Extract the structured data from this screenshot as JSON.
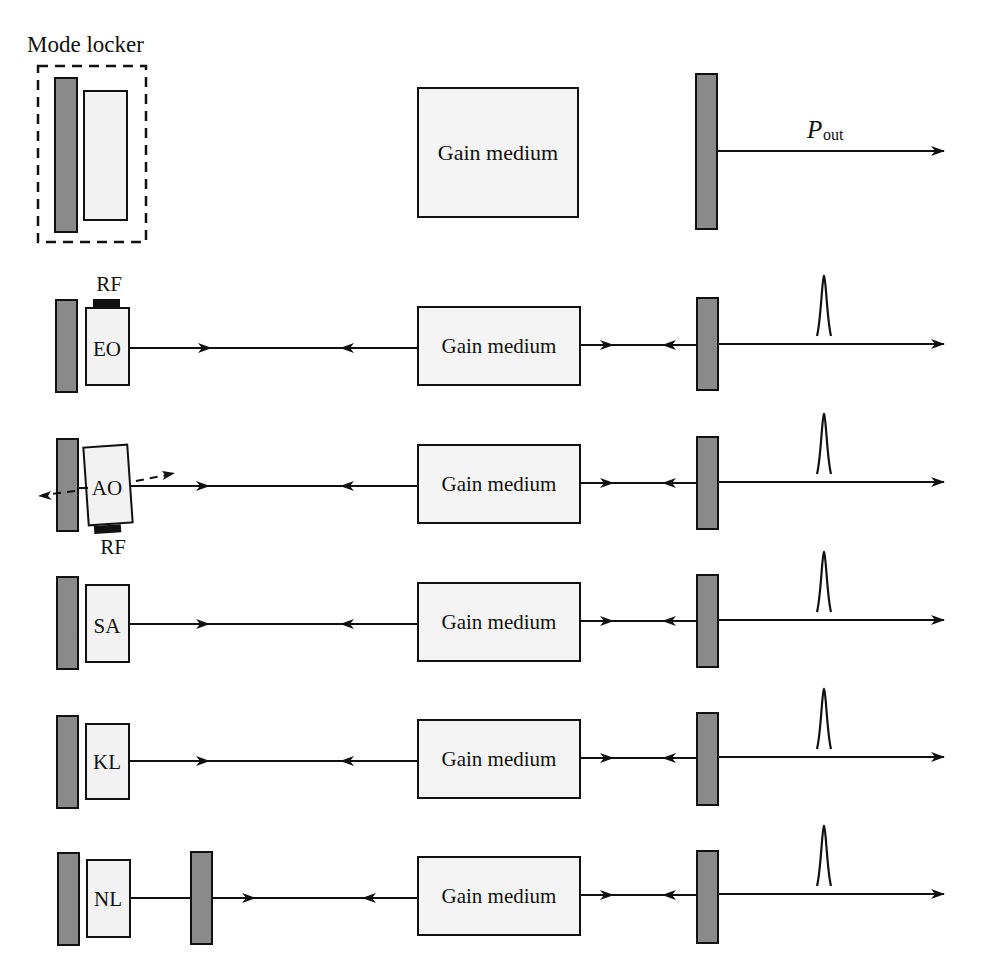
{
  "colors": {
    "mirror_fill": "#8a8a8a",
    "element_fill": "#f2f2f2",
    "stroke": "#111111",
    "background": "#ffffff"
  },
  "top_panel": {
    "mode_locker_label": "Mode locker",
    "gain_label": "Gain medium",
    "output_label_main": "P",
    "output_label_sub": "out"
  },
  "rows": [
    {
      "id": "eo",
      "element_label": "EO",
      "rf_label": "RF",
      "rf_position": "top",
      "gain_label": "Gain medium"
    },
    {
      "id": "ao",
      "element_label": "AO",
      "rf_label": "RF",
      "rf_position": "bottom",
      "gain_label": "Gain medium"
    },
    {
      "id": "sa",
      "element_label": "SA",
      "gain_label": "Gain medium"
    },
    {
      "id": "kl",
      "element_label": "KL",
      "gain_label": "Gain medium"
    },
    {
      "id": "nl",
      "element_label": "NL",
      "gain_label": "Gain medium"
    }
  ]
}
